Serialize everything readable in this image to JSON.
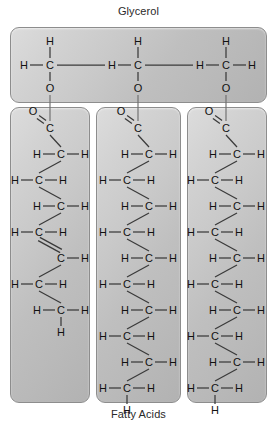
{
  "diagram": {
    "name": "triglyceride-structure",
    "top_label": "Glycerol",
    "bottom_label": "Fatty Acids",
    "atoms": {
      "carbon": "C",
      "hydrogen": "H",
      "oxygen": "O"
    },
    "colors": {
      "panel_fill_light": "#dcdcdc",
      "panel_fill_dark": "#b2b2b2",
      "panel_border": "#8d8d8d",
      "bond": "#3a3a3a",
      "text": "#111111",
      "background": "#ffffff"
    }
  },
  "glycerol": {
    "label": "Glycerol",
    "carbon_count": 3,
    "units": [
      {
        "top_h": "H",
        "left_h": "H",
        "center": "C",
        "right_h": "",
        "bottom_o": "O"
      },
      {
        "top_h": "H",
        "left_h": "H",
        "center": "C",
        "right_h": "",
        "bottom_o": "O"
      },
      {
        "top_h": "H",
        "left_h": "H",
        "center": "C",
        "right_h": "H",
        "bottom_o": "O"
      }
    ]
  },
  "fatty_acids": {
    "label": "Fatty Acids",
    "chains": [
      {
        "name": "unsaturated-fatty-acid",
        "saturated": false,
        "carbon_count": 8,
        "carbonyl": {
          "oxygen": "O",
          "carbon": "C",
          "bond": "double"
        },
        "units": [
          {
            "center": "C",
            "left_h": "H",
            "right_h": "H",
            "next_bond": "single"
          },
          {
            "center": "C",
            "left_h": "H",
            "right_h": "H",
            "next_bond": "single"
          },
          {
            "center": "C",
            "left_h": "H",
            "right_h": "H",
            "next_bond": "single"
          },
          {
            "center": "C",
            "left_h": "H",
            "right_h": "H",
            "next_bond": "double"
          },
          {
            "center": "C",
            "left_h": "",
            "right_h": "H",
            "next_bond": "single"
          },
          {
            "center": "C",
            "left_h": "H",
            "right_h": "H",
            "next_bond": "single"
          },
          {
            "center": "C",
            "left_h": "H",
            "right_h": "H",
            "next_bond": "single"
          }
        ],
        "terminal_h": "H"
      },
      {
        "name": "saturated-fatty-acid-1",
        "saturated": true,
        "carbon_count": 11,
        "carbonyl": {
          "oxygen": "O",
          "carbon": "C",
          "bond": "double"
        },
        "units": [
          {
            "center": "C",
            "left_h": "H",
            "right_h": "H",
            "next_bond": "single"
          },
          {
            "center": "C",
            "left_h": "H",
            "right_h": "H",
            "next_bond": "single"
          },
          {
            "center": "C",
            "left_h": "H",
            "right_h": "H",
            "next_bond": "single"
          },
          {
            "center": "C",
            "left_h": "H",
            "right_h": "H",
            "next_bond": "single"
          },
          {
            "center": "C",
            "left_h": "H",
            "right_h": "H",
            "next_bond": "single"
          },
          {
            "center": "C",
            "left_h": "H",
            "right_h": "H",
            "next_bond": "single"
          },
          {
            "center": "C",
            "left_h": "H",
            "right_h": "H",
            "next_bond": "single"
          },
          {
            "center": "C",
            "left_h": "H",
            "right_h": "H",
            "next_bond": "single"
          },
          {
            "center": "C",
            "left_h": "H",
            "right_h": "H",
            "next_bond": "single"
          },
          {
            "center": "C",
            "left_h": "H",
            "right_h": "H",
            "next_bond": "single"
          }
        ],
        "terminal_h": "H"
      },
      {
        "name": "saturated-fatty-acid-2",
        "saturated": true,
        "carbon_count": 11,
        "carbonyl": {
          "oxygen": "O",
          "carbon": "C",
          "bond": "double"
        },
        "units": [
          {
            "center": "C",
            "left_h": "H",
            "right_h": "H",
            "next_bond": "single"
          },
          {
            "center": "C",
            "left_h": "H",
            "right_h": "H",
            "next_bond": "single"
          },
          {
            "center": "C",
            "left_h": "H",
            "right_h": "H",
            "next_bond": "single"
          },
          {
            "center": "C",
            "left_h": "H",
            "right_h": "H",
            "next_bond": "single"
          },
          {
            "center": "C",
            "left_h": "H",
            "right_h": "H",
            "next_bond": "single"
          },
          {
            "center": "C",
            "left_h": "H",
            "right_h": "H",
            "next_bond": "single"
          },
          {
            "center": "C",
            "left_h": "H",
            "right_h": "H",
            "next_bond": "single"
          },
          {
            "center": "C",
            "left_h": "H",
            "right_h": "H",
            "next_bond": "single"
          },
          {
            "center": "C",
            "left_h": "H",
            "right_h": "H",
            "next_bond": "single"
          },
          {
            "center": "C",
            "left_h": "H",
            "right_h": "H",
            "next_bond": "single"
          }
        ],
        "terminal_h": "H"
      }
    ]
  },
  "geometry": {
    "glycerol_carbon_x": [
      50,
      138,
      226
    ],
    "glycerol_center_y": 65,
    "glycerol_top_h_y": 41,
    "glycerol_bottom_o_y": 88,
    "chain_anchor_x": [
      50,
      138,
      226
    ],
    "chain_first_carbon_y": 128,
    "row_step": 26,
    "zig_offset": 11
  }
}
